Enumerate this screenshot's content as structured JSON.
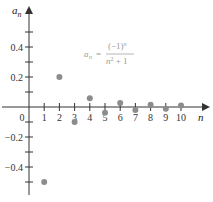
{
  "chart_data": {
    "type": "scatter",
    "title": "",
    "xlabel": "n",
    "ylabel": "a_n",
    "formula": {
      "lhs": "a",
      "lhs_sub": "n",
      "numerator": "(−1)",
      "numerator_sup": "n",
      "denominator": "n",
      "denominator_sup": "2",
      "denominator_rest": " + 1"
    },
    "x": [
      1,
      2,
      3,
      4,
      5,
      6,
      7,
      8,
      9,
      10
    ],
    "values": [
      -0.5,
      0.2,
      -0.1,
      0.0588,
      -0.0385,
      0.027,
      -0.02,
      0.0154,
      -0.0122,
      0.0099
    ],
    "x_ticks": [
      "0",
      "1",
      "2",
      "3",
      "4",
      "5",
      "6",
      "7",
      "8",
      "9",
      "10"
    ],
    "y_ticks": [
      "0.4",
      "0.2",
      "−0.2",
      "−0.4"
    ],
    "xlim": [
      0,
      11
    ],
    "ylim": [
      -0.6,
      0.6
    ],
    "grid": false,
    "legend": "none",
    "point_color": "#8c8c8c",
    "axis_color": "#333333"
  }
}
